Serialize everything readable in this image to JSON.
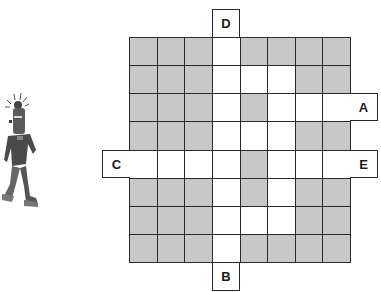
{
  "puzzle": {
    "rows": 8,
    "cols": 8,
    "legend": {
      "G": "shaded",
      "W": "open path"
    },
    "colors": {
      "shaded": "#c8c8c8",
      "open": "#ffffff",
      "line": "#2a2a2a"
    },
    "grid": [
      [
        "G",
        "G",
        "G",
        "W",
        "G",
        "G",
        "G",
        "G"
      ],
      [
        "G",
        "G",
        "G",
        "W",
        "W",
        "W",
        "G",
        "G"
      ],
      [
        "G",
        "G",
        "G",
        "W",
        "G",
        "W",
        "W",
        "W"
      ],
      [
        "G",
        "G",
        "G",
        "W",
        "W",
        "W",
        "G",
        "G"
      ],
      [
        "W",
        "W",
        "W",
        "W",
        "G",
        "W",
        "W",
        "W"
      ],
      [
        "G",
        "G",
        "G",
        "W",
        "G",
        "W",
        "G",
        "G"
      ],
      [
        "G",
        "G",
        "G",
        "W",
        "W",
        "W",
        "G",
        "G"
      ],
      [
        "G",
        "G",
        "G",
        "W",
        "G",
        "G",
        "G",
        "G"
      ]
    ],
    "exits": {
      "D": {
        "label": "D",
        "side": "top",
        "col": 3
      },
      "B": {
        "label": "B",
        "side": "bottom",
        "col": 3
      },
      "A": {
        "label": "A",
        "side": "right",
        "row": 2
      },
      "E": {
        "label": "E",
        "side": "right",
        "row": 4
      },
      "C": {
        "label": "C",
        "side": "left",
        "row": 4
      }
    }
  },
  "figure": {
    "icon": "robot-figure-icon"
  }
}
